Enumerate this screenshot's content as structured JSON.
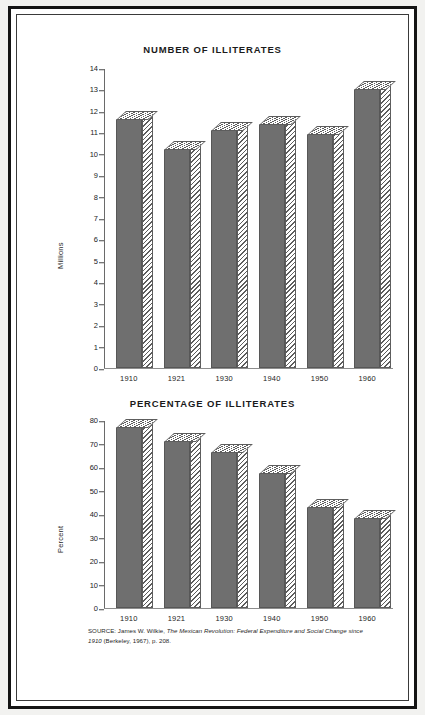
{
  "figure": {
    "source_note": {
      "prefix": "SOURCE: James W. Wilkie, ",
      "title_part_1": "The Mexican Revolution: Federal Expenditure and Social Change since 1910",
      "suffix": " (Berkeley, 1967), p. 208."
    }
  },
  "chart_data": [
    {
      "id": "number-of-illiterates",
      "type": "bar",
      "title": "NUMBER OF ILLITERATES",
      "xlabel": "",
      "ylabel": "Millions",
      "categories": [
        "1910",
        "1921",
        "1930",
        "1940",
        "1950",
        "1960"
      ],
      "values": [
        11.6,
        10.2,
        11.1,
        11.4,
        10.9,
        13.0
      ],
      "ylim": [
        0,
        14
      ],
      "yticks": [
        0,
        1,
        2,
        3,
        4,
        5,
        6,
        7,
        8,
        9,
        10,
        11,
        12,
        13,
        14
      ],
      "ytick_labels": [
        "0",
        "1",
        "2",
        "3",
        "4",
        "5",
        "6",
        "7",
        "8",
        "9",
        "10",
        "11",
        "12",
        "13",
        "14"
      ],
      "grid": false,
      "legend": "none",
      "bar_fill_color": "#6f6f6f",
      "bar_edge_color": "#575757",
      "bar_hatch_color": "#5d5d5d"
    },
    {
      "id": "percentage-of-illiterates",
      "type": "bar",
      "title": "PERCENTAGE OF ILLITERATES",
      "xlabel": "",
      "ylabel": "Percent",
      "categories": [
        "1910",
        "1921",
        "1930",
        "1940",
        "1950",
        "1960"
      ],
      "values": [
        77,
        71,
        66.5,
        57.5,
        43,
        38.5
      ],
      "ylim": [
        0,
        80
      ],
      "yticks": [
        0,
        10,
        20,
        30,
        40,
        50,
        60,
        70,
        80
      ],
      "ytick_labels": [
        "0",
        "10",
        "20",
        "30",
        "40",
        "50",
        "60",
        "70",
        "80"
      ],
      "grid": false,
      "legend": "none",
      "bar_fill_color": "#6f6f6f",
      "bar_edge_color": "#575757",
      "bar_hatch_color": "#5d5d5d"
    }
  ]
}
